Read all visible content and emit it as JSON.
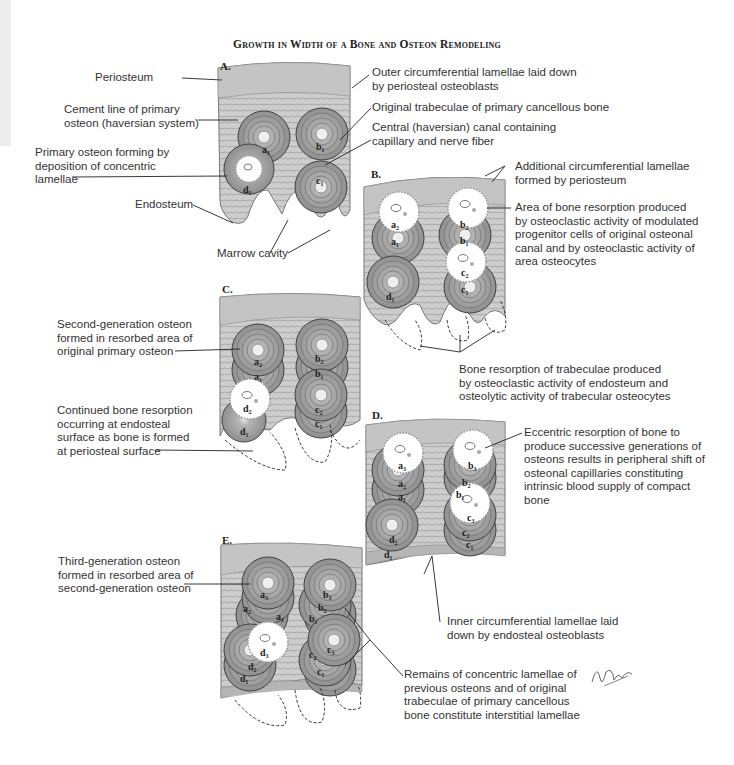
{
  "title": "Growth in Width of a Bone and Osteon Remodeling",
  "colors": {
    "bone_fill": "#c9c9c9",
    "osteon_fill": "#a8a8a8",
    "line": "#555555",
    "resorption_fill": "#ffffff",
    "text": "#333333"
  },
  "panels": {
    "A": {
      "letter": "A.",
      "osteons": [
        "a1",
        "b1",
        "c1",
        "d1"
      ],
      "labels": {
        "periosteum": "Periosteum",
        "cement_line": "Cement line of primary\nosteon (haversian system)",
        "primary_osteon": "Primary osteon forming by\ndeposition of concentric\nlamellae",
        "endosteum": "Endosteum",
        "marrow_cavity": "Marrow cavity",
        "outer_lamellae": "Outer circumferential lamellae laid down\nby periosteal osteoblasts",
        "original_trabeculae": "Original trabeculae of primary cancellous bone",
        "central_canal": "Central (haversian) canal containing\ncapillary and nerve fiber"
      }
    },
    "B": {
      "letter": "B.",
      "osteons": [
        "a2",
        "a1",
        "b2",
        "b1",
        "c2",
        "c1",
        "d1"
      ],
      "labels": {
        "additional_lamellae": "Additional circumferential lamellae\nformed by periosteum",
        "area_resorption": "Area of bone resorption produced\nby osteoclastic activity of modulated\nprogenitor cells of original osteonal\ncanal and by osteoclastic activity of\narea osteocytes",
        "trabeculae_resorption": "Bone resorption of trabeculae produced\nby osteoclastic activity of endosteum and\nosteolytic activity of trabecular osteocytes"
      }
    },
    "C": {
      "letter": "C.",
      "osteons": [
        "a2",
        "a1",
        "b2",
        "b1",
        "c2",
        "c1",
        "d2",
        "d1"
      ],
      "labels": {
        "second_generation": "Second-generation osteon\nformed in resorbed area of\noriginal primary osteon",
        "continued_resorption": "Continued bone resorption\noccurring at endosteal\nsurface as bone is formed\nat periosteal surface"
      }
    },
    "D": {
      "letter": "D.",
      "osteons": [
        "a3",
        "a2",
        "a1",
        "b3",
        "b2",
        "b1",
        "c3",
        "c2",
        "c1",
        "d2",
        "d1"
      ],
      "labels": {
        "eccentric_resorption": "Eccentric resorption of bone to\nproduce successive generations of\nosteons results in peripheral shift of\nosteonal capillaries constituting\nintrinsic blood supply of compact\nbone",
        "inner_lamellae": "Inner circumferential lamellae laid\ndown by endosteal osteoblasts"
      }
    },
    "E": {
      "letter": "E.",
      "osteons": [
        "a3",
        "a2",
        "a1",
        "b3",
        "b2",
        "b1",
        "c3",
        "c2",
        "c1",
        "d3",
        "d2",
        "d1"
      ],
      "labels": {
        "third_generation": "Third-generation osteon\nformed in resorbed area of\nsecond-generation osteon",
        "remains": "Remains of concentric lamellae of\nprevious osteons and of original\ntrabeculae of primary cancellous\nbone constitute interstitial lamellae"
      }
    }
  },
  "signature": "F. Netter M.D."
}
